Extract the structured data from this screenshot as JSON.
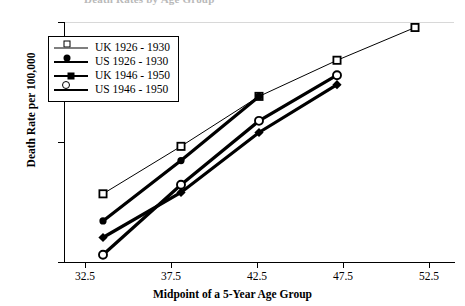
{
  "title_fragment": "Death Rates by Age Group",
  "axes": {
    "y_label": "Death Rate per 100,000",
    "y_ticks": [
      "100",
      "10",
      "1"
    ],
    "x_label": "Midpoint of a 5-Year Age Group",
    "x_ticks": [
      "32.5",
      "37.5",
      "42.5",
      "47.5",
      "52.5"
    ]
  },
  "legend": {
    "items": [
      {
        "label": "UK  1926 - 1930",
        "marker": "square-open-marker",
        "weight": "thin"
      },
      {
        "label": "US  1926 - 1930",
        "marker": "circle-filled-marker",
        "weight": "thick"
      },
      {
        "label": "UK  1946 - 1950",
        "marker": "diamond-filled-marker",
        "weight": "thick"
      },
      {
        "label": "US  1946 - 1950",
        "marker": "circle-open-marker",
        "weight": "thin"
      }
    ]
  },
  "chart_data": {
    "type": "line",
    "title": "Death Rates by Age Group",
    "xlabel": "Midpoint of a 5-Year Age Group",
    "ylabel": "Death Rate per 100,000",
    "yscale": "log",
    "ylim": [
      1,
      100
    ],
    "xlim": [
      30,
      55
    ],
    "grid": false,
    "legend_position": "top-left",
    "x": [
      32.5,
      37.5,
      42.5,
      47.5,
      52.5
    ],
    "series": [
      {
        "name": "UK  1926 - 1930",
        "marker": "square-open-marker",
        "linewidth": "thin",
        "x": [
          32.5,
          37.5,
          42.5,
          47.5,
          52.5
        ],
        "values": [
          3.7,
          9.2,
          24.0,
          48.0,
          90.0
        ]
      },
      {
        "name": "US  1926 - 1930",
        "marker": "circle-filled-marker",
        "linewidth": "thick",
        "x": [
          32.5,
          37.5,
          42.5
        ],
        "values": [
          2.2,
          7.0,
          24.0
        ]
      },
      {
        "name": "UK  1946 - 1950",
        "marker": "diamond-filled-marker",
        "linewidth": "thick",
        "x": [
          32.5,
          37.5,
          42.5,
          47.5
        ],
        "values": [
          1.6,
          3.8,
          12.0,
          30.0
        ]
      },
      {
        "name": "US  1946 - 1950",
        "marker": "circle-open-marker",
        "linewidth": "thick",
        "x": [
          32.5,
          37.5,
          42.5,
          47.5
        ],
        "values": [
          1.15,
          4.4,
          15.0,
          36.0
        ]
      }
    ]
  }
}
